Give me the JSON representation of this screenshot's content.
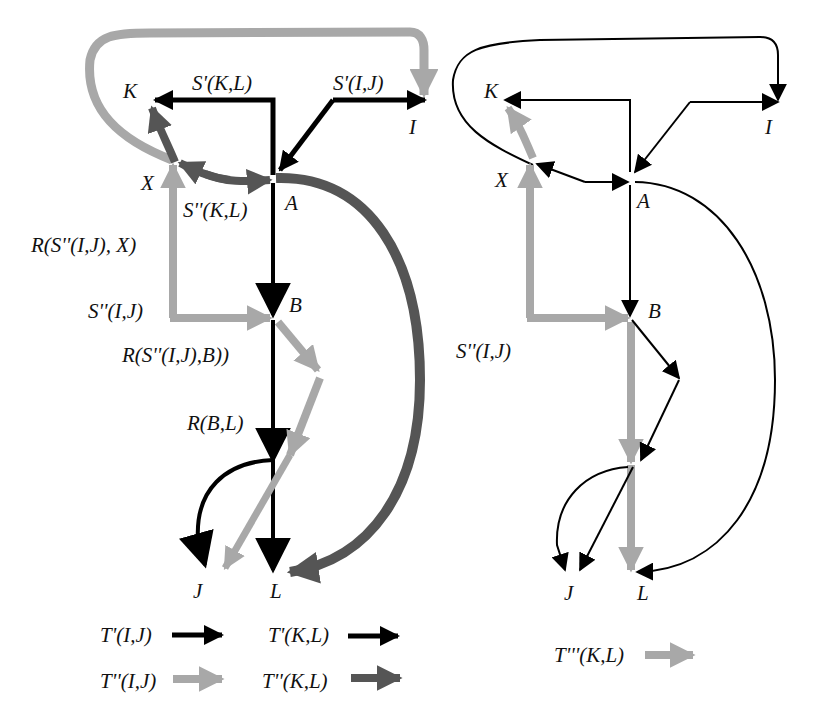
{
  "colors": {
    "black": "#000000",
    "light_gray": "#a8a8a8",
    "dark_gray": "#555555"
  },
  "left_diagram": {
    "nodes": {
      "K": "K",
      "I": "I",
      "X": "X",
      "A": "A",
      "B": "B",
      "J": "J",
      "L": "L"
    },
    "edge_labels": {
      "s1_kl": "S'(K,L)",
      "s1_ij": "S'(I,J)",
      "s2_kl": "S''(K,L)",
      "r_s2ij_x": "R(S''(I,J), X)",
      "s2_ij": "S''(I,J)",
      "r_s2ij_b": "R(S''(I,J),B))",
      "r_bl": "R(B,L)"
    },
    "legend": [
      {
        "label": "T'(I,J)",
        "color": "black",
        "style": "black"
      },
      {
        "label": "T'(K,L)",
        "color": "black",
        "style": "black"
      },
      {
        "label": "T''(I,J)",
        "color": "light gray",
        "style": "light_gray"
      },
      {
        "label": "T''(K,L)",
        "color": "dark gray",
        "style": "dark_gray"
      }
    ]
  },
  "right_diagram": {
    "nodes": {
      "K": "K",
      "I": "I",
      "X": "X",
      "A": "A",
      "B": "B",
      "J": "J",
      "L": "L"
    },
    "edge_labels": {
      "s2_ij": "S''(I,J)"
    },
    "legend": [
      {
        "label": "T'''(K,L)",
        "color": "light gray",
        "style": "light_gray"
      }
    ]
  }
}
